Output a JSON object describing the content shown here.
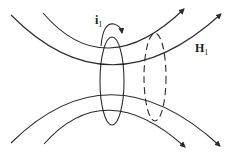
{
  "diagram": {
    "type": "magnetic-field-lines-through-loops",
    "labels": {
      "current": {
        "main": "i",
        "sub": "1"
      },
      "field": {
        "main": "H",
        "sub": "1"
      }
    },
    "elements": {
      "field_lines": 4,
      "solid_loop": "current-carrying loop",
      "dashed_loop": "second loop (dashed)",
      "current_arrow": "curved arrow above solid loop"
    },
    "colors": {
      "stroke": "#2a2a2a",
      "background": "#ffffff"
    }
  }
}
